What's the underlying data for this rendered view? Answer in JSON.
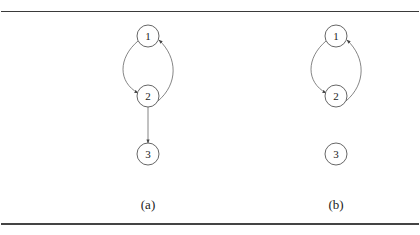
{
  "figure": {
    "panels": [
      {
        "id": "a",
        "caption": "(a)",
        "nodes": [
          {
            "id": "1",
            "label": "1"
          },
          {
            "id": "2",
            "label": "2"
          },
          {
            "id": "3",
            "label": "3"
          }
        ],
        "edges": [
          {
            "from": "1",
            "to": "2",
            "style": "curved-left"
          },
          {
            "from": "2",
            "to": "1",
            "style": "curved-right"
          },
          {
            "from": "2",
            "to": "3",
            "style": "straight"
          }
        ]
      },
      {
        "id": "b",
        "caption": "(b)",
        "nodes": [
          {
            "id": "1",
            "label": "1"
          },
          {
            "id": "2",
            "label": "2"
          },
          {
            "id": "3",
            "label": "3"
          }
        ],
        "edges": [
          {
            "from": "1",
            "to": "2",
            "style": "curved-left"
          },
          {
            "from": "2",
            "to": "1",
            "style": "curved-right"
          }
        ]
      }
    ]
  }
}
